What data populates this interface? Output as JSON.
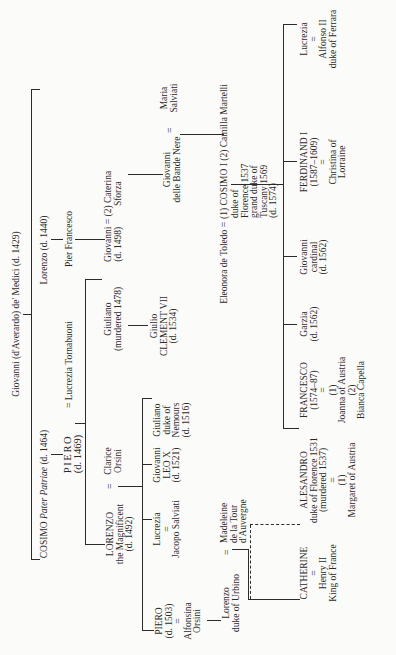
{
  "root": {
    "name": "Giovanni (d'Averardo) de' Medici (d. 1429)"
  },
  "gen1": {
    "cosimo": {
      "name": "COSIMO",
      "epithet": "Pater Patriae",
      "dates": "(d. 1464)"
    },
    "lorenzo": {
      "name": "Lorenzo",
      "dates": "(d. 1440)"
    }
  },
  "gen2": {
    "piero": {
      "name": "PIERO",
      "dates": "(d. 1469)"
    },
    "piero_spouse": {
      "marriage": "=",
      "name": "Lucrezia Tornabuoni"
    },
    "pier_francesco": {
      "name": "Pier Francesco"
    }
  },
  "gen3": {
    "lorenzo_magnificent": {
      "name": "LORENZO",
      "epithet": "the Magnificent",
      "dates": "(d. 1492)"
    },
    "clarice": {
      "marriage": "=",
      "line1": "Clarice",
      "line2": "Orsini"
    },
    "giuliano": {
      "name": "Giuliano",
      "dates": "(murdered 1478)"
    },
    "giovanni_1498": {
      "name": "Giovanni",
      "dates": "(d. 1498)",
      "marriage": "=",
      "spouse_line1": "(2) Caterina",
      "spouse_line2": "Sforza"
    }
  },
  "gen4": {
    "piero_1503": {
      "name": "PIERO",
      "dates": "(d. 1503)",
      "marriage": "=",
      "spouse_line1": "Alfonsina",
      "spouse_line2": "Orsini"
    },
    "lucrezia": {
      "name": "Lucrezia",
      "marriage": "=",
      "spouse": "Jacopo Salviati"
    },
    "giovanni_leo": {
      "name": "Giovanni",
      "title": "LEO X",
      "dates": "(d. 1521)"
    },
    "giuliano_nemours": {
      "name": "Giuliano",
      "line2": "duke of",
      "line3": "Nemours",
      "dates": "(d. 1516)"
    },
    "giulio": {
      "name": "Giulio",
      "title": "CLEMENT VII",
      "dates": "(d. 1534)"
    },
    "giovanni_bande": {
      "name": "Giovanni",
      "epithet": "delle Bande Nere",
      "marriage": "=",
      "spouse_line1": "Maria",
      "spouse_line2": "Salviati"
    }
  },
  "gen5": {
    "lorenzo_urbino": {
      "name": "Lorenzo",
      "title": "duke of Urbino",
      "marriage": "=",
      "spouse_line1": "Madeleine",
      "spouse_line2": "de la Tour",
      "spouse_line3": "d'Auvergne"
    },
    "cosimo_i": {
      "spouse1": "Eleonora de Toledo",
      "marriage": "=",
      "name": "(1) COSIMO I",
      "spouse2": "(2) Camilla Martelli",
      "line2": "duke of",
      "line3": "Florence 1537",
      "line4": "grand duke of",
      "line5": "Tuscany 1569",
      "dates": "(d. 1574)"
    }
  },
  "gen6": {
    "catherine": {
      "name": "CATHERINE",
      "marriage": "=",
      "spouse_line1": "Henry II",
      "spouse_line2": "King of France"
    },
    "alesandro": {
      "name": "ALESANDRO",
      "line2": "duke of Florence 1531",
      "dates": "(murdered 1537)",
      "marriage": "=",
      "spouse_num": "(1)",
      "spouse": "Margaret of Austria"
    },
    "francesco": {
      "name": "FRANCESCO",
      "dates": "(1574–87)",
      "marriage": "=",
      "spouse1_num": "(1)",
      "spouse1": "Joanna of Austria",
      "spouse2_num": "(2)",
      "spouse2": "Bianca Capella"
    },
    "garzia": {
      "name": "Garzia",
      "dates": "(d. 1562)"
    },
    "giovanni_cardinal": {
      "name": "Giovanni",
      "title": "cardinal",
      "dates": "(d. 1562)"
    },
    "ferdinand": {
      "name": "FERDINAND I",
      "dates": "(1587–1609)",
      "marriage": "=",
      "spouse_line1": "Christina of",
      "spouse_line2": "Lorraine"
    },
    "lucrezia_ferrara": {
      "name": "Lucrezia",
      "marriage": "=",
      "spouse_line1": "Alfonso II",
      "spouse_line2": "duke of Ferrara"
    }
  }
}
